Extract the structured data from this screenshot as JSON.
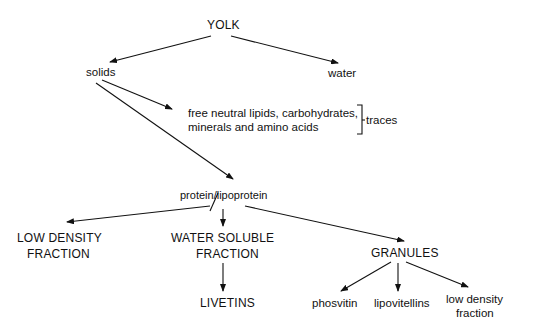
{
  "diagram": {
    "root": "YOLK",
    "level1": {
      "left": "solids",
      "right": "water"
    },
    "traces_box": {
      "line1": "free  neutral  lipids, carbohydrates,",
      "line2": "minerals  and  amino  acids",
      "bracket_label": "traces"
    },
    "protein": "protein/lipoprotein",
    "fractions": {
      "ldf_line1": "LOW   DENSITY",
      "ldf_line2": "FRACTION",
      "wsf_line1": "WATER   SOLUBLE",
      "wsf_line2": "FRACTION",
      "granules": "GRANULES"
    },
    "leaves": {
      "livetins": "LIVETINS",
      "phosvitin": "phosvitin",
      "lipovitellins": "lipovitellins",
      "ldf2_line1": "low  density",
      "ldf2_line2": "fraction"
    }
  }
}
